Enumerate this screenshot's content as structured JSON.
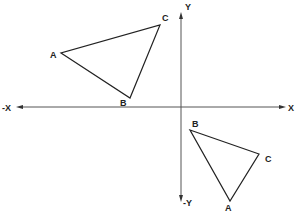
{
  "diagram": {
    "type": "coordinate-plane-triangle-transformation",
    "axes": {
      "origin": [
        181,
        107
      ],
      "x_positive_label": "X",
      "x_negative_label": "-X",
      "y_positive_label": "Y",
      "y_negative_label": "-Y"
    },
    "triangle_original": {
      "quadrant": "II",
      "vertices": [
        {
          "label": "A",
          "point": [
            61,
            53
          ],
          "label_pos": [
            50,
            58
          ]
        },
        {
          "label": "B",
          "point": [
            130,
            98
          ],
          "label_pos": [
            120,
            106
          ]
        },
        {
          "label": "C",
          "point": [
            160,
            25
          ],
          "label_pos": [
            162,
            21
          ]
        }
      ]
    },
    "triangle_transformed": {
      "quadrant": "IV",
      "vertices": [
        {
          "label": "A",
          "point": [
            230,
            201
          ],
          "label_pos": [
            225,
            211
          ]
        },
        {
          "label": "B",
          "point": [
            190,
            130
          ],
          "label_pos": [
            192,
            127
          ]
        },
        {
          "label": "C",
          "point": [
            259,
            154
          ],
          "label_pos": [
            265,
            162
          ]
        }
      ]
    },
    "colors": {
      "line": "#222222",
      "axis": "#555555",
      "background": "#ffffff"
    }
  }
}
